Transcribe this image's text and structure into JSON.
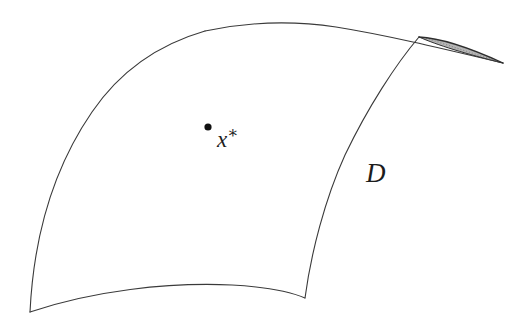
{
  "figure": {
    "background_color": "#ffffff",
    "width": 524,
    "height": 326,
    "stroke_color": "#3a3a3a",
    "stroke_width": 1.1,
    "shaded_region_fill": "#a8a8a8",
    "shaded_region_stroke": "#2e2e2e",
    "marker_color": "#111111"
  },
  "labels": {
    "domain": "D",
    "point_base": "x",
    "point_superscript": "∗",
    "point_full": "x∗"
  },
  "geometry": {
    "point_marker": {
      "cx": 208,
      "cy": 127,
      "r": 3.6
    },
    "corners": {
      "bottom_left_cusp": [
        30,
        312
      ],
      "bottom_right": [
        305,
        298
      ],
      "top_apex": [
        320,
        24
      ],
      "upper_right_tip": [
        503,
        63
      ]
    },
    "shaded_sliver": {
      "start": [
        419,
        37
      ],
      "tip": [
        503,
        63
      ],
      "description": "thin stippled crescent between two nearly tangent curves"
    }
  }
}
